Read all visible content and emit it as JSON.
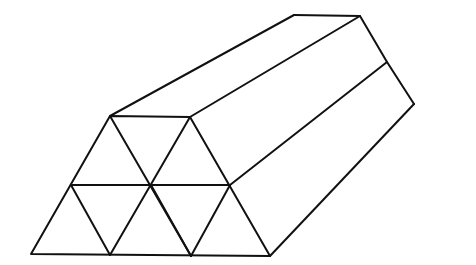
{
  "diagram": {
    "stroke_color": "#111111",
    "background": "#ffffff",
    "front_face": {
      "rows": 2,
      "triangles": 9,
      "vertices": {
        "bottom": [
          [
            31,
            254
          ],
          [
            110,
            255
          ],
          [
            191,
            256
          ],
          [
            270,
            256
          ]
        ],
        "middle": [
          [
            71,
            185
          ],
          [
            151,
            185
          ],
          [
            230,
            185
          ]
        ],
        "top": [
          [
            110,
            116
          ],
          [
            190,
            117
          ]
        ]
      }
    },
    "back_edges": {
      "top_left_back": [
        294,
        15
      ],
      "top_right_back": [
        360,
        16
      ],
      "mid_right_back": [
        387,
        62
      ],
      "bottom_right_back": [
        414,
        104
      ]
    }
  }
}
